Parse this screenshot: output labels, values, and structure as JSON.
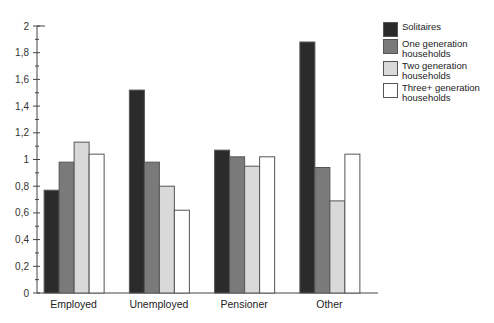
{
  "chart_data": {
    "type": "bar",
    "title": "",
    "xlabel": "",
    "ylabel": "",
    "categories": [
      "Employed",
      "Unemployed",
      "Pensioner",
      "Other"
    ],
    "series": [
      {
        "name": "Solitaires",
        "color": "#2b2b2b",
        "values": [
          0.77,
          1.52,
          1.07,
          1.88
        ]
      },
      {
        "name": "One generation households",
        "color": "#7a7a7a",
        "values": [
          0.98,
          0.98,
          1.02,
          0.94
        ]
      },
      {
        "name": "Two generation households",
        "color": "#d9d9d9",
        "values": [
          1.13,
          0.8,
          0.95,
          0.69
        ]
      },
      {
        "name": "Three+ generation households",
        "color": "#ffffff",
        "values": [
          1.04,
          0.62,
          1.02,
          1.04
        ]
      }
    ],
    "ylim": [
      0,
      2
    ],
    "yticks": [
      "0",
      "0,2",
      "0,4",
      "0,6",
      "0,8",
      "1",
      "1,2",
      "1,4",
      "1,6",
      "1,8",
      "2"
    ],
    "grid": false,
    "legend_position": "right"
  },
  "legend": {
    "items": [
      {
        "line1": "Solitaires",
        "line2": ""
      },
      {
        "line1": "One generation",
        "line2": "households"
      },
      {
        "line1": "Two generation",
        "line2": "households"
      },
      {
        "line1": "Three+ generation",
        "line2": "households"
      }
    ]
  }
}
